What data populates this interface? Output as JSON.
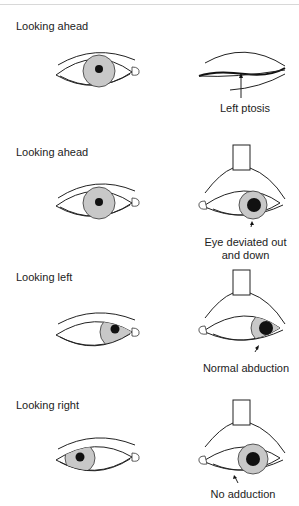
{
  "figure": {
    "rows": [
      {
        "label": "Looking ahead",
        "left_eye": {
          "gaze": "center",
          "state": "normal"
        },
        "right_eye": {
          "state": "closed-ptosis",
          "caption": "Left ptosis"
        }
      },
      {
        "label": "Looking ahead",
        "left_eye": {
          "gaze": "center",
          "state": "normal"
        },
        "right_eye": {
          "state": "lid-held-open",
          "gaze": "out-and-down",
          "caption": "Eye deviated out and down",
          "caption_lines": [
            "Eye deviated out",
            "and down"
          ]
        }
      },
      {
        "label": "Looking left",
        "left_eye": {
          "gaze": "left",
          "state": "normal"
        },
        "right_eye": {
          "state": "lid-held-open",
          "gaze": "left",
          "caption": "Normal abduction"
        }
      },
      {
        "label": "Looking right",
        "left_eye": {
          "gaze": "right",
          "state": "normal"
        },
        "right_eye": {
          "state": "lid-held-open",
          "gaze": "center",
          "caption": "No adduction"
        }
      }
    ],
    "colors": {
      "iris": "#c8c8c8",
      "pupil": "#111111",
      "line": "#222222"
    }
  }
}
